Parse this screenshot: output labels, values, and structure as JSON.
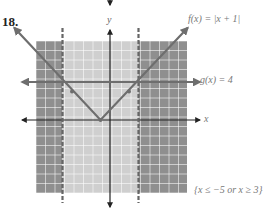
{
  "problem": {
    "number": "18."
  },
  "labels": {
    "f": "f(x) = |x + 1|",
    "g": "g(x) = 4",
    "x_axis": "x",
    "y_axis": "y",
    "solution": "{x ≤ −5 or x ≥ 3}"
  },
  "colors": {
    "outer_shade": "#8f8f8f",
    "inner_shade": "#cfcfcf",
    "grid_line": "#ffffff",
    "graph_line": "#6e6e6e",
    "axis": "#222222"
  },
  "chart_data": {
    "type": "line",
    "title": "18.",
    "xlabel": "x",
    "ylabel": "y",
    "xlim": [
      -8,
      8
    ],
    "ylim": [
      -8,
      8
    ],
    "grid": true,
    "series": [
      {
        "name": "f(x) = |x + 1|",
        "points": [
          [
            -9,
            8
          ],
          [
            -1,
            0
          ],
          [
            7,
            8
          ]
        ]
      },
      {
        "name": "g(x) = 4",
        "points": [
          [
            -9,
            4
          ],
          [
            9,
            4
          ]
        ]
      }
    ],
    "intersections": [
      [
        -5,
        4
      ],
      [
        3,
        4
      ]
    ],
    "boundaries": [
      {
        "x": -5,
        "style": "dashed"
      },
      {
        "x": 3,
        "style": "dashed"
      }
    ],
    "shaded_regions": [
      {
        "range": "x ≤ -5",
        "shade": "dark"
      },
      {
        "range": "-5 < x < 3",
        "shade": "light"
      },
      {
        "range": "x ≥ 3",
        "shade": "dark"
      }
    ],
    "solution": "{x ≤ −5 or x ≥ 3}"
  }
}
